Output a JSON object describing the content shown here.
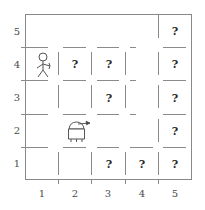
{
  "diagram": {
    "type": "grid-maze",
    "title": "",
    "grid": {
      "cols": 5,
      "rows": 5
    },
    "axis": {
      "x_labels": [
        "1",
        "2",
        "3",
        "4",
        "5"
      ],
      "y_labels": [
        "1",
        "2",
        "3",
        "4",
        "5"
      ]
    },
    "colors": {
      "wall": "#8a8a8a",
      "border": "#888888",
      "text": "#2b2b2b",
      "axis_text": "#4a4a4a",
      "background": "#ffffff"
    },
    "agents": [
      {
        "name": "person",
        "icon": "stick-figure-icon",
        "cell": [
          1,
          4
        ],
        "label": ""
      },
      {
        "name": "robot",
        "icon": "robot-icon",
        "cell": [
          2,
          2
        ],
        "heading": "east",
        "label": ""
      }
    ],
    "unknown_cells": [
      {
        "cell": [
          5,
          5
        ],
        "label": "?"
      },
      {
        "cell": [
          2,
          4
        ],
        "label": "?"
      },
      {
        "cell": [
          3,
          4
        ],
        "label": "?"
      },
      {
        "cell": [
          5,
          4
        ],
        "label": "?"
      },
      {
        "cell": [
          3,
          3
        ],
        "label": "?"
      },
      {
        "cell": [
          5,
          3
        ],
        "label": "?"
      },
      {
        "cell": [
          5,
          2
        ],
        "label": "?"
      },
      {
        "cell": [
          3,
          1
        ],
        "label": "?"
      },
      {
        "cell": [
          4,
          1
        ],
        "label": "?"
      },
      {
        "cell": [
          5,
          1
        ],
        "label": "?"
      }
    ],
    "walls": {
      "horizontal": [
        {
          "col": 1,
          "y": 4.5,
          "style": "dashed"
        },
        {
          "col": 2,
          "y": 4.5,
          "style": "dashed"
        },
        {
          "col": 3,
          "y": 4.5,
          "style": "dashed"
        },
        {
          "col": 5,
          "y": 4.5,
          "style": "dashed"
        },
        {
          "col": 1,
          "y": 3.5,
          "style": "dashed"
        },
        {
          "col": 2,
          "y": 3.5,
          "style": "dashed"
        },
        {
          "col": 3,
          "y": 3.5,
          "style": "dashed"
        },
        {
          "col": 5,
          "y": 3.5,
          "style": "dashed"
        },
        {
          "col": 1,
          "y": 2.5,
          "style": "dashed"
        },
        {
          "col": 2,
          "y": 2.5,
          "style": "dashed"
        },
        {
          "col": 3,
          "y": 2.5,
          "style": "dashed"
        },
        {
          "col": 5,
          "y": 2.5,
          "style": "dashed"
        },
        {
          "col": 1,
          "y": 1.5,
          "style": "dashed"
        },
        {
          "col": 2,
          "y": 1.5,
          "style": "dashed"
        },
        {
          "col": 3,
          "y": 1.5,
          "style": "dashed"
        },
        {
          "col": 4,
          "y": 1.5,
          "style": "dashed"
        },
        {
          "col": 5,
          "y": 1.5,
          "style": "dashed"
        }
      ],
      "vertical": [
        {
          "row": 5,
          "x": 4.5,
          "style": "dashed"
        },
        {
          "row": 4,
          "x": 1.5,
          "style": "dashed"
        },
        {
          "row": 4,
          "x": 2.5,
          "style": "dashed"
        },
        {
          "row": 4,
          "x": 3.5,
          "style": "dashed"
        },
        {
          "row": 4,
          "x": 4.5,
          "style": "dashed"
        },
        {
          "row": 3,
          "x": 1.5,
          "style": "dashed"
        },
        {
          "row": 3,
          "x": 2.5,
          "style": "dashed"
        },
        {
          "row": 3,
          "x": 3.5,
          "style": "dashed"
        },
        {
          "row": 3,
          "x": 4.5,
          "style": "dashed"
        },
        {
          "row": 2,
          "x": 4.5,
          "style": "dashed"
        },
        {
          "row": 1,
          "x": 1.5,
          "style": "dashed"
        },
        {
          "row": 1,
          "x": 2.5,
          "style": "dashed"
        },
        {
          "row": 1,
          "x": 3.5,
          "style": "dashed"
        },
        {
          "row": 1,
          "x": 4.5,
          "style": "dashed"
        }
      ]
    }
  }
}
